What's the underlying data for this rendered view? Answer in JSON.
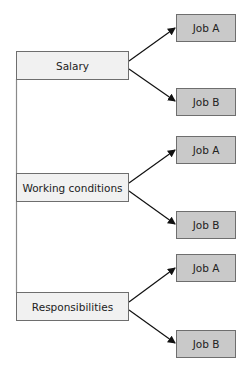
{
  "diagram": {
    "type": "tree",
    "top_text_cut_off": "",
    "criteria": [
      {
        "label": "Salary",
        "options": [
          {
            "label": "Job A"
          },
          {
            "label": "Job B"
          }
        ]
      },
      {
        "label": "Working conditions",
        "options": [
          {
            "label": "Job A"
          },
          {
            "label": "Job B"
          }
        ]
      },
      {
        "label": "Responsibilities",
        "options": [
          {
            "label": "Job A"
          },
          {
            "label": "Job B"
          }
        ]
      }
    ],
    "colors": {
      "criterion_fill": "#f1f1f1",
      "option_fill": "#c9c9c9",
      "border": "#6e6e6e",
      "arrow": "#111111",
      "trunk_line": "#8a8a8a"
    }
  }
}
